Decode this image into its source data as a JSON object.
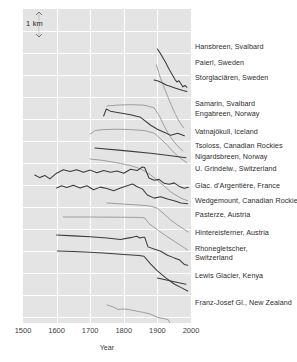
{
  "figure": {
    "scalebar": {
      "label": "1 km",
      "name": "vertical-scale-bar"
    },
    "xaxis": {
      "title": "Year",
      "ticks": [
        "1500",
        "1600",
        "1700",
        "1800",
        "1900",
        "2000"
      ]
    }
  },
  "chart_data": {
    "type": "line",
    "title": "",
    "subtitle": "",
    "xlabel": "Year",
    "ylabel": "",
    "ylabel_note": "Cumulative glacier length change; vertical scale bar = 1 km",
    "xlim": [
      1500,
      2000
    ],
    "grid": true,
    "gridlines_x": [
      1600,
      1700,
      1800,
      1900
    ],
    "legend": "right-side inline labels",
    "annotations": [
      "1 km"
    ],
    "colors": {
      "dark": "#3b3b3b",
      "light": "#9a9a9a",
      "panel": "#e4e4e4",
      "grid": "#ffffff"
    },
    "series": [
      {
        "name": "Hansbreen, Svalbard",
        "color": "dark",
        "label_y": 46,
        "x": [
          1900,
          1912,
          1925,
          1936,
          1946,
          1952,
          1958,
          1964,
          1970,
          1976,
          1982,
          1988
        ],
        "values": [
          0,
          -0.28,
          -0.62,
          -0.95,
          -1.22,
          -1.38,
          -1.5,
          -1.44,
          -1.58,
          -1.72,
          -1.66,
          -1.74
        ]
      },
      {
        "name": "Paierl, Sweden",
        "color": "light",
        "label_y": 62,
        "x": [
          1897,
          1906,
          1918,
          1930,
          1942,
          1954,
          1966,
          1978
        ],
        "values": [
          0,
          -0.45,
          -0.95,
          -1.4,
          -1.85,
          -2.25,
          -2.6,
          -2.85
        ]
      },
      {
        "name": "Storglaciären, Sweden",
        "color": "dark",
        "label_y": 77,
        "x": [
          1890,
          1902,
          1915,
          1928,
          1940,
          1952,
          1964,
          1976,
          1988
        ],
        "values": [
          0,
          -0.05,
          -0.14,
          -0.24,
          -0.3,
          -0.36,
          -0.42,
          -0.48,
          -0.52
        ]
      },
      {
        "name": "Samarin, Svalbard",
        "color": "light",
        "label_y": 103,
        "x": [
          1750,
          1780,
          1820,
          1860,
          1890,
          1906,
          1920,
          1934,
          1948,
          1962,
          1976
        ],
        "values": [
          0,
          0.04,
          0.06,
          0.04,
          -0.08,
          -0.45,
          -0.9,
          -1.3,
          -1.6,
          -1.85,
          -2.05
        ]
      },
      {
        "name": "Engabreen, Norway",
        "color": "dark",
        "label_y": 113,
        "x": [
          1740,
          1748,
          1760,
          1790,
          1820,
          1850,
          1880,
          1900,
          1920,
          1940,
          1960,
          1980
        ],
        "values": [
          0,
          0.32,
          0.22,
          0.14,
          0.06,
          -0.06,
          -0.42,
          -0.6,
          -0.74,
          -0.88,
          -0.78,
          -0.9
        ]
      },
      {
        "name": "Vatnajökull, Iceland",
        "color": "light",
        "label_y": 131,
        "x": [
          1700,
          1715,
          1740,
          1780,
          1820,
          1860,
          1890,
          1910,
          1930,
          1950,
          1970,
          1988
        ],
        "values": [
          0,
          0.16,
          0.2,
          0.22,
          0.2,
          0.16,
          0.04,
          -0.22,
          -0.52,
          -0.86,
          -1.12,
          -1.3
        ]
      },
      {
        "name": "Tsoloss, Canadian Rockies",
        "color": "dark",
        "label_y": 145,
        "x": [
          1714,
          1800,
          1880,
          1940,
          1985
        ],
        "values": [
          0,
          -0.12,
          -0.24,
          -0.35,
          -0.44
        ]
      },
      {
        "name": "Nigardsbreen, Norway",
        "color": "light",
        "label_y": 156,
        "x": [
          1700,
          1730,
          1760,
          1790,
          1820,
          1850,
          1880,
          1910,
          1940,
          1970,
          1990
        ],
        "values": [
          0,
          -0.05,
          -0.12,
          -0.2,
          -0.3,
          -0.45,
          -0.72,
          -1.1,
          -1.5,
          -1.78,
          -1.9
        ]
      },
      {
        "name": "U. Grindelw., Switzerland",
        "color": "dark",
        "label_y": 168,
        "x": [
          1535,
          1550,
          1565,
          1580,
          1600,
          1620,
          1640,
          1660,
          1680,
          1700,
          1720,
          1740,
          1760,
          1780,
          1800,
          1820,
          1840,
          1855,
          1862,
          1875,
          1890,
          1905,
          1920,
          1935,
          1950,
          1965,
          1980,
          1992
        ],
        "values": [
          -0.18,
          -0.3,
          -0.2,
          -0.36,
          -0.1,
          0.06,
          -0.02,
          0.06,
          -0.06,
          0.04,
          -0.08,
          0.02,
          -0.06,
          0.0,
          -0.1,
          0.08,
          0.02,
          0.18,
          0.16,
          -0.32,
          -0.42,
          -0.38,
          -0.56,
          -0.6,
          -0.54,
          -0.7,
          -0.78,
          -0.74
        ]
      },
      {
        "name": "Glac. d'Argentière, France",
        "color": "dark",
        "label_y": 185,
        "x": [
          1600,
          1615,
          1630,
          1650,
          1670,
          1690,
          1710,
          1730,
          1750,
          1770,
          1790,
          1810,
          1826,
          1840,
          1855,
          1870,
          1890,
          1910,
          1930,
          1950,
          1970,
          1990
        ],
        "values": [
          0,
          0.1,
          0.02,
          0.12,
          0.0,
          0.1,
          -0.08,
          0.04,
          -0.02,
          -0.12,
          0.0,
          0.1,
          0.18,
          0.06,
          -0.04,
          -0.32,
          -0.46,
          -0.4,
          -0.5,
          -0.58,
          -0.68,
          -0.72
        ]
      },
      {
        "name": "Wedgemount, Canadian Rockies",
        "color": "light",
        "label_y": 200,
        "x": [
          1750,
          1800,
          1850,
          1880,
          1900,
          1920,
          1940,
          1960,
          1980,
          1992
        ],
        "values": [
          0,
          -0.05,
          -0.1,
          -0.14,
          -0.24,
          -0.5,
          -0.78,
          -1.0,
          -1.2,
          -1.32
        ]
      },
      {
        "name": "Pasterze, Austria",
        "color": "light",
        "label_y": 214,
        "x": [
          1620,
          1700,
          1790,
          1850,
          1862,
          1875,
          1900,
          1925,
          1950,
          1975,
          1990
        ],
        "values": [
          0,
          0.0,
          -0.01,
          -0.02,
          -0.04,
          -0.3,
          -0.58,
          -0.85,
          -1.1,
          -1.35,
          -1.5
        ]
      },
      {
        "name": "Hintereisferner, Austria",
        "color": "dark",
        "label_y": 232,
        "x": [
          1600,
          1650,
          1700,
          1750,
          1790,
          1820,
          1838,
          1848,
          1856,
          1862,
          1872,
          1890,
          1910,
          1930,
          1950,
          1965,
          1980,
          1990
        ],
        "values": [
          0,
          -0.04,
          -0.08,
          -0.14,
          -0.2,
          -0.12,
          -0.06,
          -0.14,
          -0.1,
          -0.1,
          -0.54,
          -0.64,
          -0.74,
          -0.92,
          -1.04,
          -1.12,
          -1.34,
          -1.38
        ]
      },
      {
        "name": "Rhonegletscher, Switzerland",
        "color": "dark",
        "label_y": 248,
        "label_y2": 257,
        "x": [
          1602,
          1650,
          1700,
          1750,
          1800,
          1845,
          1860,
          1880,
          1900,
          1925,
          1950,
          1975,
          1990
        ],
        "values": [
          0,
          -0.02,
          -0.06,
          -0.1,
          -0.16,
          -0.2,
          -0.24,
          -0.6,
          -0.9,
          -1.22,
          -1.5,
          -1.7,
          -1.82
        ]
      },
      {
        "name": "Lewis Glacier, Kenya",
        "color": "dark",
        "label_y": 275,
        "x": [
          1900,
          1930,
          1960,
          1985
        ],
        "values": [
          0,
          -0.1,
          -0.2,
          -0.28
        ]
      },
      {
        "name": "Franz-Josef Gl., New Zealand",
        "color": "light",
        "label_y": 302,
        "x": [
          1750,
          1770,
          1782,
          1800,
          1820,
          1845,
          1860,
          1880,
          1900,
          1920,
          1932,
          1940,
          1948,
          1954,
          1960,
          1966,
          1972,
          1978,
          1982,
          1985,
          1988,
          1992
        ],
        "values": [
          0,
          -0.1,
          -0.2,
          -0.18,
          -0.22,
          -0.3,
          -0.34,
          -0.42,
          -0.56,
          -0.62,
          -0.66,
          -0.9,
          -0.86,
          -1.1,
          -1.2,
          -1.5,
          -1.9,
          -2.2,
          -2.4,
          -1.9,
          -2.5,
          -1.95
        ]
      }
    ]
  }
}
